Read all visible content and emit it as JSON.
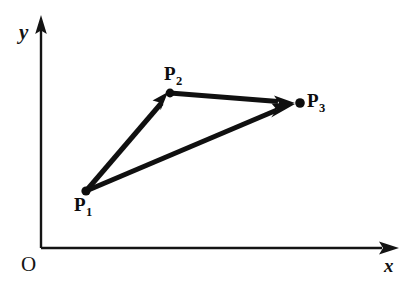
{
  "diagram": {
    "background_color": "#ffffff",
    "ink_color": "#111111",
    "axes": {
      "origin_label": "O",
      "x_axis_label": "x",
      "y_axis_label": "y",
      "origin_px": [
        41,
        248
      ],
      "x_axis_tip_px": [
        398,
        248
      ],
      "y_axis_tip_px": [
        41,
        17
      ],
      "line_width_px": 2.2,
      "arrowhead": "solid-triangle"
    },
    "points": [
      {
        "id": "P1",
        "label": "P",
        "subscript": "1",
        "x_px": 86,
        "y_px": 191,
        "dot_radius_px": 4.4,
        "label_position": "below-left"
      },
      {
        "id": "P2",
        "label": "P",
        "subscript": "2",
        "x_px": 170,
        "y_px": 93,
        "dot_radius_px": 4.4,
        "label_position": "above"
      },
      {
        "id": "P3",
        "label": "P",
        "subscript": "3",
        "x_px": 300,
        "y_px": 103,
        "dot_radius_px": 4.6,
        "label_position": "right"
      }
    ],
    "vectors": [
      {
        "id": "v-p1-p2",
        "from": "P1",
        "to": "P2",
        "arrow": true,
        "stroke_width_px": 5.0
      },
      {
        "id": "v-p2-p3",
        "from": "P2",
        "to": "P3",
        "arrow": true,
        "stroke_width_px": 5.0
      },
      {
        "id": "v-p1-p3",
        "from": "P1",
        "to": "P3",
        "arrow": true,
        "stroke_width_px": 5.0
      }
    ]
  }
}
